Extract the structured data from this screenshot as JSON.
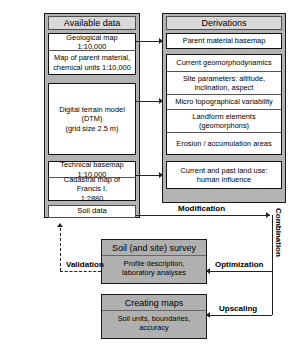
{
  "figure": {
    "type": "flowchart"
  },
  "columns": [
    {
      "id": "available-data",
      "header": "Available data",
      "groups": [
        {
          "id": "maps-group",
          "rows": [
            "Geological map 1:10,000",
            "Map of parent material,\nchemical units 1:10,000"
          ]
        },
        {
          "id": "dtm-group",
          "rows": [
            "Digital terrain model (DTM)\n(grid size 2.5 m)"
          ]
        },
        {
          "id": "basemap-group",
          "rows": [
            "Technical basemap 1:10,000",
            "Cadastral map of Francis I.\n1:2880"
          ]
        }
      ],
      "standalone": [
        "Soil data"
      ]
    },
    {
      "id": "derivations",
      "header": "Derivations",
      "groups": [
        {
          "id": "parent-material-group",
          "rows": [
            "Parent material basemap"
          ]
        },
        {
          "id": "geomorphology-group",
          "rows": [
            "Current geomorphodynamics",
            "Site parameters: altitude,\ninclination, aspect",
            "Micro topographical variability",
            "Landform elements\n(geomorphons)",
            "Erosion / accumulation areas"
          ]
        },
        {
          "id": "landuse-group",
          "rows": [
            "Current and past land use:\nhuman influence"
          ]
        }
      ]
    }
  ],
  "process_boxes": [
    {
      "id": "soil-survey",
      "title": "Soil (and site) survey",
      "subtitle": "Profile description,\nlaboratory analyses"
    },
    {
      "id": "creating-maps",
      "title": "Creating maps",
      "subtitle": "Soil units, boundaries,\naccuracy"
    }
  ],
  "connector_labels": {
    "modification": "Modification",
    "combination": "Combination",
    "optimization": "Optimization",
    "upscaling": "Upscaling",
    "validation": "Validation"
  },
  "colors": {
    "panel_fill": "#b3b3b3",
    "cell_fill": "#ffffff",
    "process_fill": "#b0b0b0",
    "line": "#222222",
    "text": "#000000"
  }
}
